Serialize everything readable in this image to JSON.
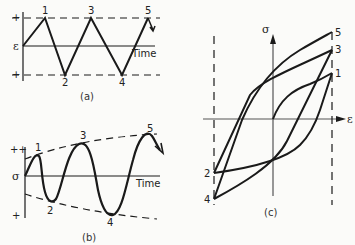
{
  "panels": {
    "a": {
      "caption": "(a)",
      "axis_symbol": "ε",
      "time_label": "Time",
      "plus": "+",
      "minus": "+",
      "points": [
        "1",
        "2",
        "3",
        "4",
        "5"
      ],
      "description": "Strain-controlled triangular waveform of constant amplitude"
    },
    "b": {
      "caption": "(b)",
      "axis_symbol": "σ",
      "time_label": "Time",
      "plus": "++",
      "minus": "+",
      "points": [
        "1",
        "2",
        "3",
        "4",
        "5"
      ],
      "description": "Resulting stress response with increasing amplitude (cyclic hardening)"
    },
    "c": {
      "caption": "(c)",
      "y_symbol": "σ",
      "x_symbol": "ε",
      "points": [
        "5",
        "3",
        "1",
        "2",
        "4"
      ],
      "description": "Stress-strain hysteresis loops"
    }
  },
  "colors": {
    "ink": "#1a1a1a",
    "background": "#fbfbf9"
  }
}
